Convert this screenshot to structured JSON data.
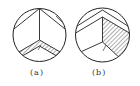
{
  "figure": {
    "panels": [
      {
        "id": "a",
        "caption": "(a)",
        "description": "Circle with vertical radius from top, two chords from top point, hatched chevron band in lower half"
      },
      {
        "id": "b",
        "caption": "(b)",
        "description": "Circle with two nested top chevrons, vertical line, hatched right sector, Y-shaped lines in lower half"
      }
    ],
    "colors": {
      "stroke": "#222222",
      "hatch": "#333333",
      "background": "#ffffff"
    }
  }
}
